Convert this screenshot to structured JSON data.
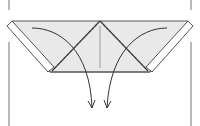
{
  "diagram": {
    "type": "origami-fold-step",
    "description": "Paper with side flaps folded diagonally toward the center; curved arrows indicate folding the two top corners down along the diagonal lines.",
    "colors": {
      "paper_fill": "#e9e9e9",
      "paper_back": "#ffffff",
      "line": "#555555",
      "frame": "#777777"
    },
    "elements": {
      "left_frame_line": "left-edge",
      "right_frame_line": "right-edge",
      "paper": "paper-body",
      "left_flap": "left-folded-strip",
      "right_flap": "right-folded-strip",
      "center_crease": "center-crease",
      "left_fold_line": "left-diagonal-fold",
      "right_fold_line": "right-diagonal-fold",
      "left_arrow": "fold-down-arrow-left",
      "right_arrow": "fold-down-arrow-right"
    }
  }
}
